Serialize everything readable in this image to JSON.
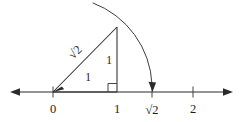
{
  "figure": {
    "background_color": "#ffffff",
    "ink_color": "#2b2b2b",
    "width": 243,
    "height": 122
  },
  "axis": {
    "name": "number-line",
    "y": 92,
    "x_start": 10,
    "x_end": 233,
    "left_arrow": true,
    "right_arrow": true,
    "ticks": [
      {
        "label": "0",
        "x": 53,
        "value": 0
      },
      {
        "label": "1",
        "x": 117,
        "value": 1
      },
      {
        "label": "√2",
        "x": 152,
        "value": 1.414
      },
      {
        "label": "2",
        "x": 193,
        "value": 2
      }
    ]
  },
  "triangle": {
    "name": "right-triangle",
    "vertices": {
      "origin": {
        "x": 53,
        "y": 92
      },
      "foot": {
        "x": 117,
        "y": 92
      },
      "apex": {
        "x": 117,
        "y": 27
      }
    },
    "labels": {
      "base": "1",
      "height": "1",
      "hypotenuse": "√2"
    },
    "right_angle_marker": true
  },
  "arc": {
    "name": "compass-arc",
    "center": {
      "x": 53,
      "y": 92
    },
    "radius": 91,
    "from": {
      "x": 93,
      "y": 3
    },
    "through": {
      "x": 117,
      "y": 27
    },
    "to": {
      "x": 152,
      "y": 88
    },
    "arrow_at_end": true
  },
  "labels": {
    "tick_zero": "0",
    "tick_one": "1",
    "tick_root_two": "√2",
    "tick_two": "2",
    "base_length": "1",
    "height_length": "1",
    "hypotenuse_length": "√2"
  }
}
